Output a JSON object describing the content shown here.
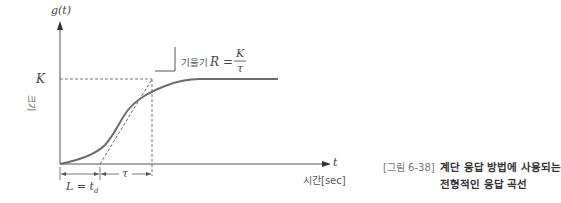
{
  "diagram": {
    "y_axis_label": "g(t)",
    "y_axis_name": "크기",
    "x_axis_label": "t",
    "x_axis_name": "시간[sec]",
    "steady_state_label": "K",
    "slope_annotation": {
      "prefix": "기울기",
      "variable": "R",
      "equals": "=",
      "numerator": "K",
      "denominator": "τ"
    },
    "delay_label": "L = t",
    "delay_subscript": "d",
    "time_constant_label": "τ"
  },
  "caption": {
    "figure_label": "[그림 6-38]",
    "title_line1": "계단 응답 방법에 사용되는",
    "title_line2": "전형적인 응답 곡선"
  },
  "colors": {
    "curve": "#6b6b6b",
    "axis": "#555555",
    "dashed": "#666666"
  }
}
